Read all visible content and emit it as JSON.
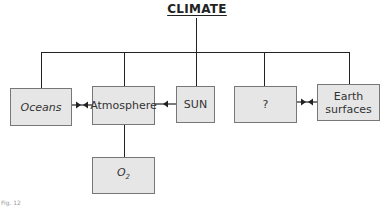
{
  "diagram": {
    "title": "CLIMATE",
    "nodes": [
      {
        "id": "oceans",
        "label": "Oceans"
      },
      {
        "id": "atmosphere",
        "label": "Atmosphere"
      },
      {
        "id": "sun",
        "label": "SUN"
      },
      {
        "id": "unknown",
        "label": "?"
      },
      {
        "id": "earth_surfaces",
        "label_line1": "Earth",
        "label_line2": "surfaces"
      },
      {
        "id": "o2",
        "label_base": "O",
        "label_sub": "2"
      }
    ],
    "edges": [
      {
        "from": "climate",
        "to": "oceans",
        "type": "tree-line"
      },
      {
        "from": "climate",
        "to": "atmosphere",
        "type": "tree-line"
      },
      {
        "from": "climate",
        "to": "sun",
        "type": "tree-line"
      },
      {
        "from": "climate",
        "to": "unknown",
        "type": "tree-line"
      },
      {
        "from": "climate",
        "to": "earth_surfaces",
        "type": "tree-line"
      },
      {
        "from": "oceans",
        "to": "atmosphere",
        "type": "bidirectional-arrow"
      },
      {
        "from": "sun",
        "to": "atmosphere",
        "type": "arrow"
      },
      {
        "from": "unknown",
        "to": "earth_surfaces",
        "type": "bidirectional-arrow"
      },
      {
        "from": "atmosphere",
        "to": "o2",
        "type": "line"
      }
    ],
    "colors": {
      "box_fill": "#e6e6e6",
      "box_border": "#777777",
      "line": "#222222"
    },
    "caption": "Fig. 12"
  }
}
